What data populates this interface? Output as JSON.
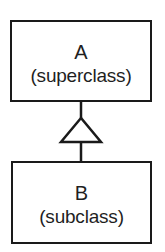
{
  "diagram": {
    "type": "uml-inheritance",
    "superclass": {
      "name": "A",
      "role": "(superclass)"
    },
    "subclass": {
      "name": "B",
      "role": "(subclass)"
    },
    "relationship": {
      "type": "generalization",
      "from": "B",
      "to": "A",
      "arrowhead": "hollow-triangle"
    },
    "colors": {
      "stroke": "#1a1a1a",
      "fill": "#ffffff",
      "text": "#1f1f1f"
    }
  }
}
